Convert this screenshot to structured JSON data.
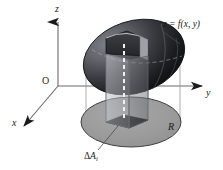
{
  "figure": {
    "background_color": "#ffffff",
    "axes": {
      "origin_label": "O",
      "x_label": "x",
      "y_label": "y",
      "z_label": "z",
      "axis_color": "#6b6b6b",
      "arrow_color": "#1a1a1a"
    },
    "labels": {
      "surface": "z = f(x, y)",
      "region": "R",
      "area_element_delta": "Δ",
      "area_element_A": "A",
      "area_element_sub": "i"
    },
    "colors": {
      "surface_dark": "#15161a",
      "surface_mid": "#4e5055",
      "surface_light": "#8d9097",
      "region_fill": "#9a9a9a",
      "region_stroke": "#3a3a3a",
      "area_element_fill": "#0a0a0a",
      "prism_face_light": "#b9bcc2",
      "prism_face_dark": "#6f7278",
      "leader_line": "#4a4a4a",
      "dashed_line": "#e8e8e8"
    },
    "geometry": {
      "z_axis_top": 14,
      "y_axis_right": 203,
      "x_axis_end": 22,
      "origin_x": 58,
      "origin_y": 86,
      "dome_center_x": 134,
      "dome_center_y": 57,
      "region_center_x": 131,
      "region_center_y": 122
    }
  }
}
